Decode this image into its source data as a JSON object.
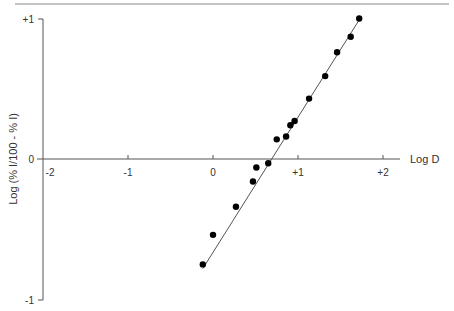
{
  "chart_data": {
    "type": "scatter",
    "title": "",
    "xlabel": "Log D",
    "ylabel": "Log (% I/100 - % I)",
    "xlim": [
      -2,
      2
    ],
    "ylim": [
      -1,
      1
    ],
    "grid": false,
    "legend": null,
    "x_ticks": [
      "-2",
      "-1",
      "0",
      "+1",
      "+2"
    ],
    "y_ticks": [
      "+1",
      "0",
      "-1"
    ],
    "series": [
      {
        "name": "data",
        "x": [
          -0.12,
          0.0,
          0.27,
          0.47,
          0.51,
          0.65,
          0.75,
          0.86,
          0.91,
          0.96,
          1.13,
          1.32,
          1.46,
          1.62,
          1.72
        ],
        "y": [
          -0.75,
          -0.54,
          -0.34,
          -0.16,
          -0.06,
          -0.03,
          0.14,
          0.16,
          0.24,
          0.27,
          0.43,
          0.59,
          0.76,
          0.87,
          1.0
        ]
      }
    ],
    "fit_line": {
      "x": [
        -0.12,
        1.73
      ],
      "y": [
        -0.78,
        1.0
      ]
    }
  },
  "labels": {
    "xlabel": "Log D",
    "ylabel": "Log (% I/100 - % I)",
    "y_plus1": "+1",
    "y_zero": "0",
    "y_minus1": "-1",
    "x_m2": "-2",
    "x_m1": "-1",
    "x_0": "0",
    "x_p1": "+1",
    "x_p2": "+2"
  }
}
